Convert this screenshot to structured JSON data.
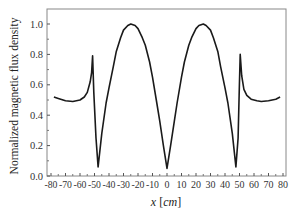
{
  "chart_data": {
    "type": "line",
    "title": "",
    "xlabel": "x [cm]",
    "xlabel_var": "x",
    "xlabel_unit": "cm",
    "ylabel": "Normalized magnetic flux density",
    "xlim": [
      -80,
      80
    ],
    "ylim": [
      0.0,
      1.1
    ],
    "grid": false,
    "legend": null,
    "x_ticks": [
      -80,
      -70,
      -60,
      -50,
      -40,
      -30,
      -20,
      -10,
      0,
      10,
      20,
      30,
      40,
      50,
      60,
      70,
      80
    ],
    "x_tick_labels": [
      "-80",
      "-70",
      "-60",
      "-50",
      "-40",
      "-30",
      "-20",
      "-10",
      "0",
      "10",
      "20",
      "30",
      "40",
      "50",
      "60",
      "70",
      "80"
    ],
    "y_ticks": [
      0.0,
      0.2,
      0.4,
      0.6,
      0.8,
      1.0
    ],
    "y_tick_labels": [
      "0.0",
      "0.2",
      "0.4",
      "0.6",
      "0.8",
      "1.0"
    ],
    "series": [
      {
        "name": "Normalized magnetic flux density",
        "color": "#1a1a1a",
        "x": [
          -78,
          -75,
          -70,
          -65,
          -60,
          -57,
          -55,
          -53,
          -52,
          -51.3,
          -50.5,
          -49,
          -47.5,
          -45,
          -42,
          -40,
          -37,
          -35,
          -32,
          -30,
          -27,
          -25,
          -22,
          -20,
          -17,
          -15,
          -12,
          -10,
          -7,
          -5,
          -2.5,
          0,
          2.5,
          5,
          7,
          10,
          12,
          15,
          17,
          20,
          22,
          25,
          27,
          30,
          32,
          35,
          37,
          40,
          42,
          45,
          47.5,
          49,
          49.8,
          50.5,
          51.5,
          53,
          55,
          58,
          62,
          65,
          70,
          75,
          78
        ],
        "y": [
          0.52,
          0.51,
          0.495,
          0.49,
          0.5,
          0.52,
          0.55,
          0.62,
          0.68,
          0.79,
          0.55,
          0.25,
          0.06,
          0.28,
          0.48,
          0.58,
          0.72,
          0.82,
          0.91,
          0.96,
          0.99,
          1.0,
          0.99,
          0.97,
          0.91,
          0.86,
          0.75,
          0.65,
          0.48,
          0.36,
          0.2,
          0.05,
          0.2,
          0.36,
          0.48,
          0.65,
          0.75,
          0.86,
          0.91,
          0.97,
          0.99,
          1.0,
          0.99,
          0.96,
          0.91,
          0.82,
          0.72,
          0.58,
          0.48,
          0.28,
          0.06,
          0.25,
          0.55,
          0.8,
          0.66,
          0.57,
          0.53,
          0.505,
          0.495,
          0.49,
          0.495,
          0.505,
          0.52
        ]
      }
    ]
  },
  "plot": {
    "frame_color": "#888888",
    "line_color": "#1a1a1a"
  }
}
